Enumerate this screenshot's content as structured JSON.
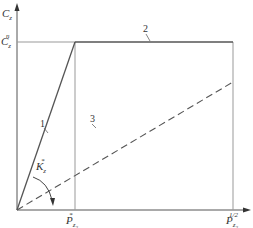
{
  "diagram": {
    "y_axis_label": {
      "main": "C",
      "sub": "z"
    },
    "y_level_label": {
      "main": "C",
      "sub": "z",
      "sup": "n"
    },
    "angle_label": {
      "main": "K",
      "sub": "z",
      "sup": "*"
    },
    "x_tick_1": {
      "main": "P",
      "sub": "z",
      "subsub": "2",
      "sup": "*"
    },
    "x_tick_2": {
      "main": "P",
      "sub": "z",
      "subsub": "2",
      "sup": "1/2"
    },
    "curves": [
      {
        "id": "1",
        "label": "1",
        "style": "solid",
        "desc": "linear rise from origin to saturation"
      },
      {
        "id": "2",
        "label": "2",
        "style": "solid",
        "desc": "horizontal plateau at C_z^n"
      },
      {
        "id": "3",
        "label": "3",
        "style": "dashed",
        "desc": "linear line from origin"
      }
    ],
    "colors": {
      "line": "#555555",
      "guide": "#999999",
      "text": "#333333"
    }
  }
}
